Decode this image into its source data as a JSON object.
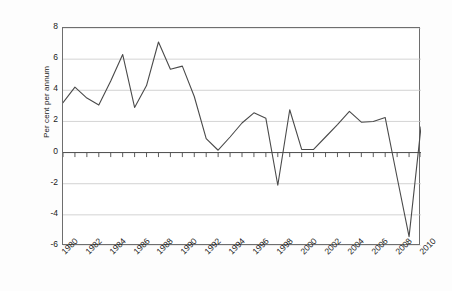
{
  "chart_data": {
    "type": "line",
    "title": "",
    "subtitle": "",
    "xlabel": "",
    "ylabel": "Per cent per annum",
    "xlim": [
      1980,
      2010
    ],
    "ylim": [
      -6,
      8
    ],
    "y_ticks": [
      8,
      6,
      4,
      2,
      0,
      -2,
      -4,
      -6
    ],
    "y_tick_labels": [
      "8",
      "6",
      "4",
      "2",
      "0",
      "-2",
      "-4",
      "-6"
    ],
    "x_ticks": [
      1980,
      1982,
      1984,
      1986,
      1988,
      1990,
      1992,
      1994,
      1996,
      1998,
      2000,
      2002,
      2004,
      2006,
      2008,
      2010
    ],
    "x_tick_labels": [
      "1980",
      "1982",
      "1984",
      "1986",
      "1988",
      "1990",
      "1992",
      "1994",
      "1996",
      "1998",
      "2000",
      "2002",
      "2004",
      "2006",
      "2008",
      "2010"
    ],
    "x_minor_tick_interval": 1,
    "grid": "horizontal",
    "grid_color": "#c8c8c8",
    "zero_line": 0,
    "legend": "none",
    "line_color": "#4a4a4a",
    "line_width": 1.1,
    "series": [
      {
        "name": "Per cent per annum",
        "x": [
          1980,
          1981,
          1982,
          1983,
          1984,
          1985,
          1986,
          1987,
          1988,
          1989,
          1990,
          1991,
          1992,
          1993,
          1994,
          1995,
          1996,
          1997,
          1998,
          1999,
          2000,
          2001,
          2002,
          2003,
          2004,
          2005,
          2006,
          2007,
          2008,
          2009,
          2010
        ],
        "values": [
          3.2,
          4.2,
          3.5,
          3.05,
          4.6,
          6.3,
          2.9,
          4.3,
          7.1,
          5.35,
          5.55,
          3.6,
          0.9,
          0.15,
          1.0,
          1.9,
          2.55,
          2.2,
          -2.1,
          2.75,
          0.2,
          0.2,
          1.0,
          1.8,
          2.65,
          1.95,
          2.0,
          2.25,
          -1.6,
          -5.4,
          1.65
        ]
      }
    ]
  },
  "axes": {
    "y_label": "Per cent per annum"
  }
}
